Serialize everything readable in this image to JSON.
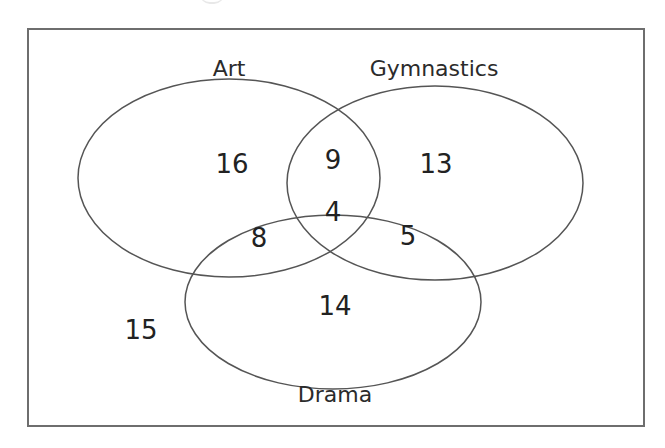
{
  "diagram": {
    "type": "venn",
    "sets": [
      {
        "id": "art",
        "label": "Art"
      },
      {
        "id": "gymnastics",
        "label": "Gymnastics"
      },
      {
        "id": "drama",
        "label": "Drama"
      }
    ],
    "regions": {
      "art_only": "16",
      "art_gymnastics_only": "9",
      "gymnastics_only": "13",
      "all_three": "4",
      "art_drama_only": "8",
      "gymnastics_drama_only": "5",
      "drama_only": "14",
      "none": "15"
    },
    "colors": {
      "frame": "#6e6e6e",
      "ellipse_stroke": "#555555",
      "text": "#222222"
    }
  }
}
